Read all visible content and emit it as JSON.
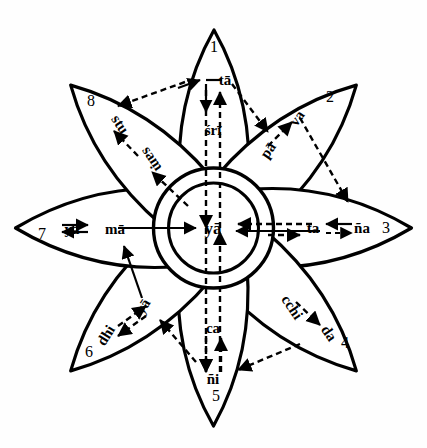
{
  "figure": {
    "center_label": "yā",
    "background_color": "#fefefe",
    "ink_color": "#000000"
  },
  "petals": [
    {
      "number": "1",
      "position": "top",
      "angle_deg": 270,
      "labels": [
        "tā",
        "śrī"
      ],
      "outer_label": "tā",
      "inner_label": "śrī"
    },
    {
      "number": "2",
      "position": "upper-right",
      "angle_deg": 315,
      "labels": [
        "va",
        "pā"
      ],
      "outer_label": "va",
      "inner_label": "pā"
    },
    {
      "number": "3",
      "position": "right",
      "angle_deg": 0,
      "labels": [
        "ña",
        "ta"
      ],
      "outer_label": "ña",
      "inner_label": "ta"
    },
    {
      "number": "4",
      "position": "lower-right",
      "angle_deg": 45,
      "labels": [
        "cchi",
        "da"
      ],
      "outer_label": "da",
      "inner_label": "cchi"
    },
    {
      "number": "5",
      "position": "bottom",
      "angle_deg": 90,
      "labels": [
        "ca",
        "ñi"
      ],
      "outer_label": "ñi",
      "inner_label": "ca"
    },
    {
      "number": "6",
      "position": "lower-left",
      "angle_deg": 135,
      "labels": [
        "dhi",
        "yā"
      ],
      "outer_label": "dhi",
      "inner_label": "yā"
    },
    {
      "number": "7",
      "position": "left",
      "angle_deg": 180,
      "labels": [
        "yā",
        "mā"
      ],
      "outer_label": "yā",
      "inner_label": "mā"
    },
    {
      "number": "8",
      "position": "upper-left",
      "angle_deg": 225,
      "labels": [
        "stu",
        "saṃ"
      ],
      "outer_label": "stu",
      "inner_label": "saṃ"
    }
  ],
  "labels": {
    "n1": "1",
    "n2": "2",
    "n3": "3",
    "n4": "4",
    "n5": "5",
    "n6": "6",
    "n7": "7",
    "n8": "8",
    "center": "yā",
    "p1_outer": "tā",
    "p1_inner": "śrī",
    "p2_outer": "va",
    "p2_inner": "pā",
    "p3_outer": "ña",
    "p3_inner": "ta",
    "p4_outer": "da",
    "p4_inner": "cchi",
    "p5_outer": "ñi",
    "p5_inner": "ca",
    "p6_outer": "dhi",
    "p6_inner": "yā",
    "p7_outer": "yā",
    "p7_inner": "mā",
    "p8_outer": "stu",
    "p8_inner": "saṃ"
  }
}
